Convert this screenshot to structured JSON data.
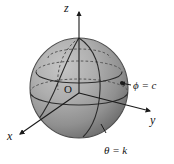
{
  "figure": {
    "background_color": "#ffffff",
    "sphere": {
      "fill_light": "#b9b9b9",
      "fill_mid": "#9a9a9a",
      "fill_dark": "#6f6f6f",
      "outline_color": "#4b4b4b",
      "center_x": 79,
      "center_y": 88,
      "radius_x": 49,
      "radius_y": 50
    },
    "axes": [
      {
        "name": "z-axis",
        "label": "z",
        "label_x": 64,
        "label_y": 3,
        "direction": "up"
      },
      {
        "name": "y-axis",
        "label": "y",
        "label_x": 150,
        "label_y": 114,
        "direction": "down-right"
      },
      {
        "name": "x-axis",
        "label": "x",
        "label_x": 7,
        "label_y": 130,
        "direction": "down-left"
      }
    ],
    "origin": {
      "label": "O",
      "x": 64,
      "y": 84
    },
    "curve_labels": [
      {
        "name": "phi-equals-c",
        "text": "ϕ = c",
        "x": 133,
        "y": 80
      },
      {
        "name": "theta-equals-k",
        "text": "θ = k",
        "x": 104,
        "y": 145
      }
    ],
    "line_color": "#2b2b2b",
    "dashed_color": "#555555"
  }
}
